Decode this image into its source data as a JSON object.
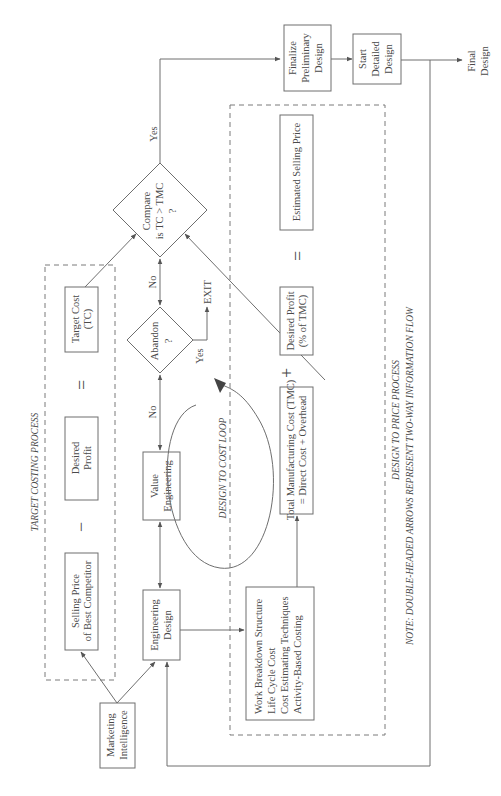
{
  "diagram": {
    "target_costing": {
      "title": "TARGET  COSTING PROCESS",
      "selling_price": [
        "Selling Price",
        "of Best Competitor"
      ],
      "minus": "−",
      "desired_profit": [
        "Desired",
        "Profit"
      ],
      "equals": "=",
      "target_cost": [
        "Target Cost",
        "(TC)"
      ]
    },
    "marketing_intelligence": [
      "Marketing",
      "Intelligence"
    ],
    "engineering_design": [
      "Engineering",
      "Design"
    ],
    "value_engineering": [
      "Value",
      "Engineering"
    ],
    "abandon": [
      "Abandon",
      "?"
    ],
    "compare": [
      "Compare",
      "is TC > TMC",
      "?"
    ],
    "labels": {
      "no_1": "No",
      "no_2": "No",
      "yes_abandon": "Yes",
      "yes_compare": "Yes",
      "exit": "EXIT"
    },
    "design_to_cost_loop": "DESIGN TO COST LOOP",
    "design_to_price": {
      "title": "DESIGN TO PRICE PROCESS",
      "tools": [
        "Work Breakdown Structure",
        "Life Cycle Cost",
        "Cost Estimating Techniques",
        "Activity-Based Costing"
      ],
      "tmc": [
        "Total Manufacturing Cost (TMC)",
        "= Direct Cost + Overhead"
      ],
      "plus": "+",
      "desired_profit": [
        "Desired Profit",
        "(% of TMC)"
      ],
      "equals": "=",
      "estimated_selling_price": "Estimated Selling Price"
    },
    "finalize_preliminary_design": [
      "Finalize",
      "Preliminary",
      "Design"
    ],
    "start_detailed_design": [
      "Start",
      "Detailed",
      "Design"
    ],
    "final_design": [
      "Final",
      "Design"
    ],
    "note": "NOTE: DOUBLE-HEADED ARROWS REPRESENT TWO-WAY INFORMATION FLOW"
  }
}
